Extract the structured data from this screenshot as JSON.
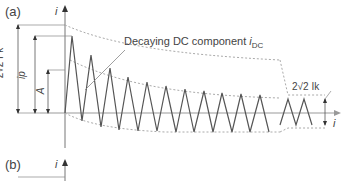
{
  "panel_a": {
    "label": "(a)",
    "y_axis_label": "i",
    "x_axis_label": "i",
    "annotation_dc": "Decaying DC component ",
    "annotation_dc_symbol": "i",
    "annotation_dc_sub": "DC",
    "dim_initial": "2√2 I″k",
    "dim_peak": "ip",
    "dim_A": "A",
    "dim_steady": "2√2 Ik"
  },
  "panel_b": {
    "label": "(b)",
    "y_axis_label": "i"
  },
  "colors": {
    "waveform": "#555555",
    "axis": "#777777",
    "dashed": "#aaaaaa"
  }
}
